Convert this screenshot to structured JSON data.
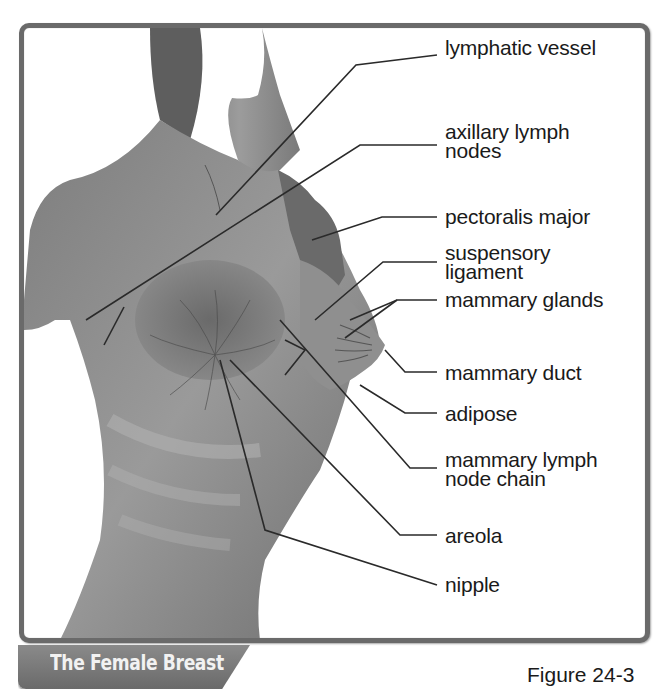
{
  "figure": {
    "title": "The Female Breast",
    "number": "Figure 24-3"
  },
  "labels": [
    {
      "id": "lymphatic-vessel",
      "text": "lymphatic vessel",
      "top": 38
    },
    {
      "id": "axillary-lymph-nodes",
      "text": "axillary lymph\nnodes",
      "top": 122
    },
    {
      "id": "pectoralis-major",
      "text": "pectoralis major",
      "top": 207
    },
    {
      "id": "suspensory-ligament",
      "text": "suspensory\nligament",
      "top": 243
    },
    {
      "id": "mammary-glands",
      "text": "mammary glands",
      "top": 290
    },
    {
      "id": "mammary-duct",
      "text": "mammary duct",
      "top": 363
    },
    {
      "id": "adipose",
      "text": "adipose",
      "top": 404
    },
    {
      "id": "mammary-lymph-node-chain",
      "text": "mammary lymph\nnode chain",
      "top": 450
    },
    {
      "id": "areola",
      "text": "areola",
      "top": 526
    },
    {
      "id": "nipple",
      "text": "nipple",
      "top": 575
    }
  ],
  "colors": {
    "frame": "#6a6a6a",
    "skin_dark": "#5a5a5a",
    "skin_mid": "#8c8c8c",
    "skin_light": "#b5b5b5",
    "leader_line": "#2a2a2a",
    "banner": "#777777",
    "banner_text": "#f2f2f2"
  }
}
